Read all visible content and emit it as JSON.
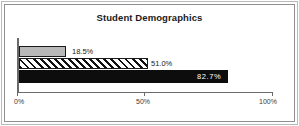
{
  "chart_data": {
    "type": "bar",
    "orientation": "horizontal",
    "title": "Student Demographics",
    "xlabel": "",
    "ylabel": "",
    "xlim": [
      0,
      100
    ],
    "grid": false,
    "legend": "none",
    "categories": [
      "",
      "",
      ""
    ],
    "values": [
      18.5,
      51.0,
      82.7
    ],
    "value_labels": [
      "18.5%",
      "51.0%",
      "82.7%"
    ],
    "tick_labels": [
      "0%",
      "50%",
      "100%"
    ],
    "ticks": [
      0,
      50,
      100
    ],
    "series": [
      {
        "name": "",
        "values": [
          18.5,
          51.0,
          82.7
        ],
        "fills": [
          "solid-gray",
          "diagonal-hatch",
          "solid-black"
        ],
        "colors": [
          "#b8b8b8",
          "#ffffff",
          "#0d0d0d"
        ]
      }
    ]
  },
  "axis": {
    "tick_0": "0%",
    "tick_50": "50%",
    "tick_100": "100%"
  },
  "bars": [
    {
      "label": "18.5%",
      "value": 18.5
    },
    {
      "label": "51.0%",
      "value": 51.0
    },
    {
      "label": "82.7%",
      "value": 82.7
    }
  ]
}
